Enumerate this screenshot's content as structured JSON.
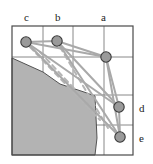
{
  "figure": {
    "title": "",
    "background_color": "#ffffff",
    "frame": {
      "x": 12,
      "y": 26,
      "width": 121,
      "height": 129,
      "stroke": "#4a4a4a",
      "stroke_width": 1.2
    },
    "grid": {
      "vertical_lines_x": [
        43,
        73,
        104
      ],
      "horizontal_lines_y": [
        57,
        95,
        125
      ],
      "stroke": "#7a7a7a",
      "stroke_width": 0.9
    },
    "obstacle": {
      "fill": "#b3b3b3",
      "stroke": "#444444",
      "stroke_width": 0.9,
      "points": "12,58 12,155 95,155 97,138 95,96 84,92 60,84 43,72"
    },
    "nodes": [
      {
        "id": "c",
        "cx": 26,
        "cy": 42,
        "r": 5.2,
        "fill": "#9a9a9a",
        "stroke": "#3a3a3a"
      },
      {
        "id": "b",
        "cx": 57,
        "cy": 41,
        "r": 5.2,
        "fill": "#9a9a9a",
        "stroke": "#3a3a3a"
      },
      {
        "id": "a",
        "cx": 106,
        "cy": 57,
        "r": 5.2,
        "fill": "#9a9a9a",
        "stroke": "#3a3a3a"
      },
      {
        "id": "d",
        "cx": 119,
        "cy": 107,
        "r": 5.2,
        "fill": "#9a9a9a",
        "stroke": "#3a3a3a"
      },
      {
        "id": "e",
        "cx": 120,
        "cy": 137,
        "r": 5.2,
        "fill": "#9a9a9a",
        "stroke": "#3a3a3a"
      }
    ],
    "edges_solid": {
      "stroke": "#a9a9a9",
      "stroke_width": 2.0,
      "segments": [
        {
          "from": "c",
          "to": "b"
        },
        {
          "from": "c",
          "to": "a"
        },
        {
          "from": "b",
          "to": "a"
        },
        {
          "from": "a",
          "to": "d"
        },
        {
          "from": "d",
          "to": "e"
        },
        {
          "from": "a",
          "to": "e"
        },
        {
          "from": "c",
          "to": "d"
        },
        {
          "from": "b",
          "to": "d"
        },
        {
          "from": "c",
          "to": "e"
        },
        {
          "from": "b",
          "to": "e"
        }
      ]
    },
    "edges_dashed": {
      "stroke": "#b5b5b5",
      "stroke_width": 2.0,
      "dash": "5,4",
      "segments": [
        {
          "x1": 30,
          "y1": 47,
          "x2": 100,
          "y2": 120
        },
        {
          "x1": 60,
          "y1": 47,
          "x2": 108,
          "y2": 128
        },
        {
          "x1": 40,
          "y1": 52,
          "x2": 96,
          "y2": 112
        }
      ]
    },
    "labels": [
      {
        "id": "label-c",
        "text": "c",
        "x": 24,
        "y": 12,
        "position": "top"
      },
      {
        "id": "label-b",
        "text": "b",
        "x": 55,
        "y": 12,
        "position": "top"
      },
      {
        "id": "label-a",
        "text": "a",
        "x": 101,
        "y": 12,
        "position": "top"
      },
      {
        "id": "label-d",
        "text": "d",
        "x": 139,
        "y": 103,
        "position": "right"
      },
      {
        "id": "label-e",
        "text": "e",
        "x": 139,
        "y": 133,
        "position": "right"
      }
    ]
  }
}
